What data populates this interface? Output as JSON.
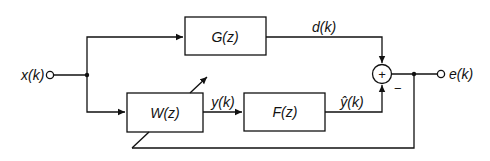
{
  "diagram": {
    "type": "block-diagram",
    "input": {
      "label": "x(k)"
    },
    "output": {
      "label": "e(k)"
    },
    "blocks": [
      {
        "id": "G",
        "label": "G(z)"
      },
      {
        "id": "W",
        "label": "W(z)",
        "adaptive": true
      },
      {
        "id": "F",
        "label": "F(z)"
      }
    ],
    "signals": {
      "desired": "d(k)",
      "filter_output": "y(k)",
      "estimate": "ŷ(k)"
    },
    "summer": {
      "symbol": "+",
      "minus_sign": "−"
    },
    "colors": {
      "line": "#111111",
      "background": "#ffffff"
    }
  }
}
